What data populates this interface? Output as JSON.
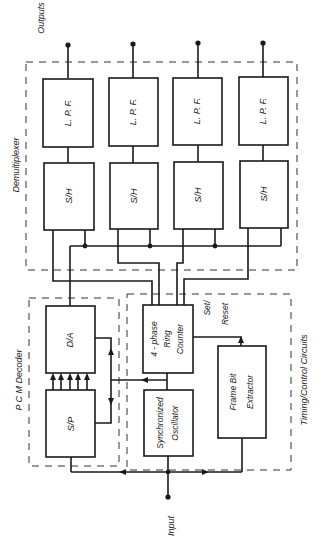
{
  "labels": {
    "outputs": "Outputs",
    "input": "Input",
    "demultiplexer": "Demultiplexer",
    "pcm_decoder": "P C M  Decoder",
    "timing_control": "Timing/Control  Circuits",
    "set_reset_1": "Set/",
    "set_reset_2": "Reset"
  },
  "blocks": {
    "lpf": [
      "L. P. F.",
      "L. P. F.",
      "L. P. F.",
      "L. P. F."
    ],
    "sh": [
      "S/H",
      "S/H",
      "S/H",
      "S/H"
    ],
    "da": "D/A",
    "sp": "S/P",
    "ring_counter": [
      "4 - phase",
      "Ring",
      "Counter"
    ],
    "sync_osc": [
      "Synchronized",
      "Oscillator"
    ],
    "frame_bit": [
      "Frame  Bit",
      "Extractor"
    ]
  },
  "channel_count": 4,
  "parallel_lines_sp_to_da": 5
}
